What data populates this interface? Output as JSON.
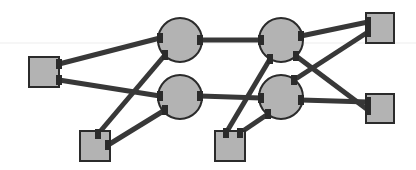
{
  "diagram": {
    "width": 416,
    "height": 170,
    "colors": {
      "background": "#ffffff",
      "node_fill": "#b3b3b3",
      "node_stroke": "#2b2b2b",
      "edge": "#383838",
      "faint_line": "#ececec"
    },
    "nodes": [
      {
        "id": "sq-left",
        "shape": "square",
        "x": 29,
        "y": 57,
        "w": 30,
        "h": 30
      },
      {
        "id": "sq-bottom-left",
        "shape": "square",
        "x": 80,
        "y": 131,
        "w": 30,
        "h": 30
      },
      {
        "id": "sq-bottom-mid",
        "shape": "square",
        "x": 215,
        "y": 131,
        "w": 30,
        "h": 30
      },
      {
        "id": "sq-top-right",
        "shape": "square",
        "x": 366,
        "y": 13,
        "w": 28,
        "h": 30
      },
      {
        "id": "sq-bottom-right",
        "shape": "square",
        "x": 366,
        "y": 94,
        "w": 28,
        "h": 29
      },
      {
        "id": "circ-top-1",
        "shape": "circle",
        "cx": 180,
        "cy": 40,
        "r": 22
      },
      {
        "id": "circ-bottom-1",
        "shape": "circle",
        "cx": 180,
        "cy": 97,
        "r": 22
      },
      {
        "id": "circ-top-2",
        "shape": "circle",
        "cx": 281,
        "cy": 40,
        "r": 22
      },
      {
        "id": "circ-bottom-2",
        "shape": "circle",
        "cx": 281,
        "cy": 97,
        "r": 22
      }
    ],
    "edges": [
      {
        "from": "sq-left",
        "to": "circ-top-1",
        "x1": 59,
        "y1": 64,
        "x2": 160,
        "y2": 38
      },
      {
        "from": "sq-left",
        "to": "circ-bottom-1",
        "x1": 59,
        "y1": 80,
        "x2": 160,
        "y2": 96
      },
      {
        "from": "sq-bottom-left",
        "to": "circ-top-1",
        "x1": 98,
        "y1": 134,
        "x2": 165,
        "y2": 55
      },
      {
        "from": "sq-bottom-left",
        "to": "circ-bottom-1",
        "x1": 108,
        "y1": 145,
        "x2": 165,
        "y2": 110
      },
      {
        "from": "circ-top-1",
        "to": "circ-top-2",
        "x1": 200,
        "y1": 40,
        "x2": 261,
        "y2": 40
      },
      {
        "from": "circ-bottom-1",
        "to": "circ-bottom-2",
        "x1": 200,
        "y1": 96,
        "x2": 261,
        "y2": 98
      },
      {
        "from": "sq-bottom-mid",
        "to": "circ-top-2",
        "x1": 226,
        "y1": 133,
        "x2": 270,
        "y2": 59
      },
      {
        "from": "sq-bottom-mid",
        "to": "circ-bottom-2",
        "x1": 240,
        "y1": 133,
        "x2": 268,
        "y2": 114
      },
      {
        "from": "circ-top-2",
        "to": "sq-top-right",
        "x1": 301,
        "y1": 36,
        "x2": 368,
        "y2": 22
      },
      {
        "from": "circ-top-2",
        "to": "sq-bottom-right",
        "x1": 296,
        "y1": 56,
        "x2": 368,
        "y2": 110
      },
      {
        "from": "circ-bottom-2",
        "to": "sq-top-right",
        "x1": 294,
        "y1": 80,
        "x2": 368,
        "y2": 32
      },
      {
        "from": "circ-bottom-2",
        "to": "sq-bottom-right",
        "x1": 301,
        "y1": 100,
        "x2": 368,
        "y2": 102
      }
    ]
  }
}
